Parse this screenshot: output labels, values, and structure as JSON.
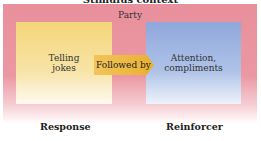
{
  "title": "Stimulus context",
  "context": {
    "label": "Party",
    "color": "#e8909c"
  },
  "response_box": {
    "text_line1": "Telling",
    "text_line2": "jokes",
    "color": "#f4d57a"
  },
  "arrow": {
    "label": "Followed by",
    "color": "#efbf4a"
  },
  "reinforcer_box": {
    "text_line1": "Attention,",
    "text_line2": "compliments",
    "color": "#8fa7dc"
  },
  "labels": {
    "response": "Response",
    "reinforcer": "Reinforcer"
  }
}
